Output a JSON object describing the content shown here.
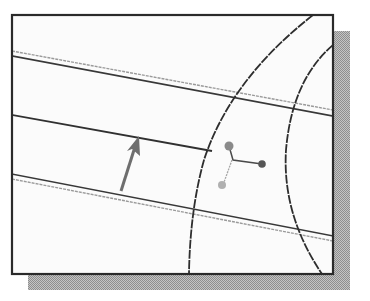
{
  "figure": {
    "caption": "CAD sketch: parallel lines, two arcs, selection arrow and node point glyph",
    "colors": {
      "background": "#ffffff",
      "frame_border": "#2a2a2a",
      "frame_fill": "#fbfbfb",
      "shadow": "#a8a8a8",
      "dark_line": "#303030",
      "grey_line": "#9a9a9a",
      "arrow": "#707070",
      "dot_dark": "#555555",
      "dot_light": "#a0a0a0"
    },
    "frame": {
      "x": 12,
      "y": 15,
      "width": 321,
      "height": 259
    },
    "shadow_offset": {
      "dx": 16,
      "dy": 16
    },
    "elements": {
      "top_line_pair": "two parallel lines (one grey, one dark) sloping down-right",
      "middle_line": "single dark line ending at the left arc",
      "bottom_line_pair": "two parallel lines (one dark, one grey) sloping down-right",
      "left_arc": "large arc from top edge to bottom edge",
      "right_arc": "arc near right edge",
      "arrow": "grey arrow pointing up toward middle line",
      "node_glyph": "three dots connected: upper, right, lower"
    }
  }
}
